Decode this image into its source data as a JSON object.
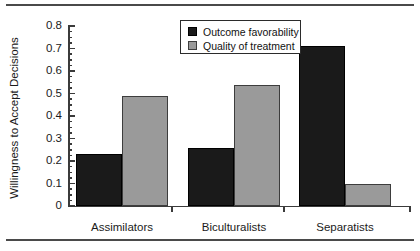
{
  "figure": {
    "background": "#ffffff",
    "rule_color": "#4a4a4a"
  },
  "legend": {
    "position": "top-center",
    "entries": [
      {
        "label": "Outcome favorability",
        "color": "#1a1a1a"
      },
      {
        "label": "Quality of treatment",
        "color": "#9a9a9a"
      }
    ]
  },
  "axes": {
    "ylabel": "Willingness to Accept Decisions",
    "ytick_labels": [
      "0.8",
      "0.7",
      "0.6",
      "0.5",
      "0.4",
      "0.3",
      "0.2",
      "0.1",
      "0"
    ],
    "xtick_labels": [
      "Assimilators",
      "Biculturalists",
      "Separatists"
    ]
  },
  "chart_data": {
    "type": "bar",
    "title": "",
    "xlabel": "",
    "ylabel": "Willingness to Accept Decisions",
    "categories": [
      "Assimilators",
      "Biculturalists",
      "Separatists"
    ],
    "series": [
      {
        "name": "Outcome favorability",
        "color": "#1a1a1a",
        "values": [
          0.23,
          0.26,
          0.71
        ]
      },
      {
        "name": "Quality of treatment",
        "color": "#9a9a9a",
        "values": [
          0.49,
          0.54,
          0.1
        ]
      }
    ],
    "ylim": [
      0,
      0.8
    ],
    "ytick_step": 0.1,
    "yminor_step": 0.025,
    "grid": false,
    "legend_position": "top-center"
  }
}
